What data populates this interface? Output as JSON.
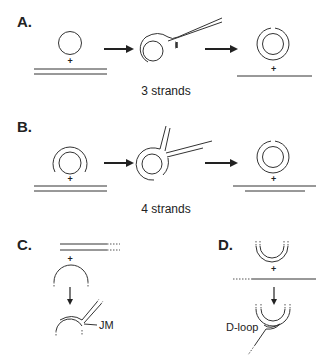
{
  "panels": {
    "a": {
      "label": "A.",
      "caption": "3 strands"
    },
    "b": {
      "label": "B.",
      "caption": "4 strands"
    },
    "c": {
      "label": "C.",
      "annotation": "JM"
    },
    "d": {
      "label": "D.",
      "annotation": "D-loop"
    }
  },
  "symbols": {
    "plus": "+"
  },
  "colors": {
    "stroke": "#333333",
    "background": "#ffffff"
  }
}
